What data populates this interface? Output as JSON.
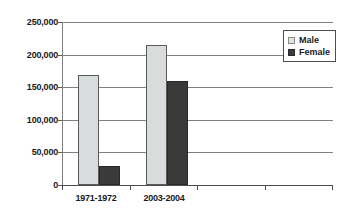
{
  "chart_data": {
    "type": "bar",
    "title": "",
    "xlabel": "",
    "ylabel": "",
    "categories": [
      "1971-1972",
      "2003-2004"
    ],
    "series": [
      {
        "name": "Male",
        "values": [
          169000,
          214000
        ],
        "color": "#d9dcdc"
      },
      {
        "name": "Female",
        "values": [
          29000,
          159000
        ],
        "color": "#3a3a38"
      }
    ],
    "ylim": [
      0,
      250000
    ],
    "yticks": [
      0,
      50000,
      100000,
      150000,
      200000,
      250000
    ],
    "ytick_labels": [
      "0",
      "50,000",
      "100,000",
      "150,000",
      "200,000",
      "250,000"
    ],
    "grid": true,
    "legend_position": "top-right",
    "empty_category_slots": 2
  },
  "legend": {
    "entries": [
      {
        "label": "Male",
        "swatch": "light-gray-square"
      },
      {
        "label": "Female",
        "swatch": "dark-square"
      }
    ]
  }
}
